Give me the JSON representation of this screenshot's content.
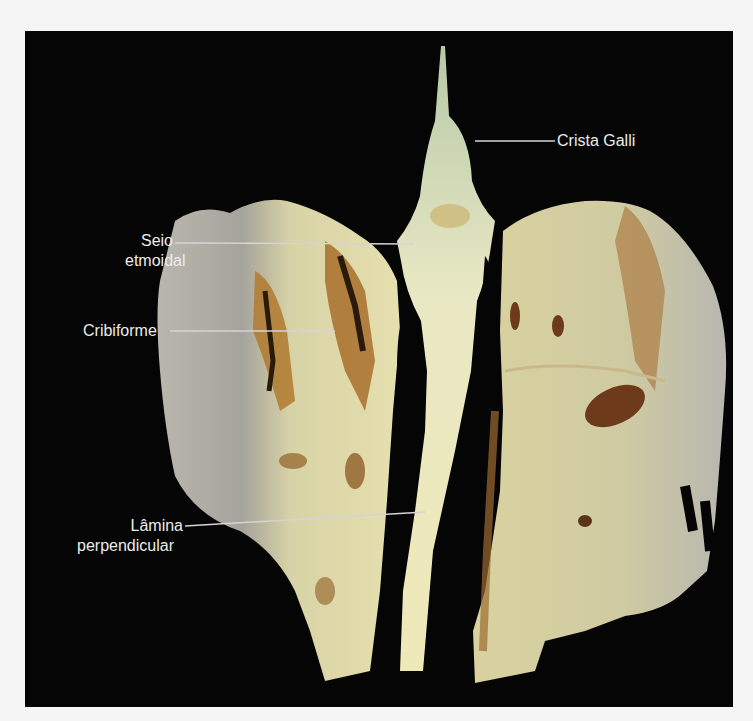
{
  "figure": {
    "background_color": "#050505",
    "page_color": "#f4f5f4",
    "label_color": "#ececec",
    "labels": [
      {
        "id": "crista-galli",
        "text": "Crista Galli"
      },
      {
        "id": "seio-etmoidal",
        "line1": "Seio",
        "line2": "etmoidal"
      },
      {
        "id": "cribiforme",
        "text": "Cribiforme"
      },
      {
        "id": "lamina-perpendicular",
        "line1": "Lâmina",
        "line2": "perpendicular"
      }
    ]
  }
}
